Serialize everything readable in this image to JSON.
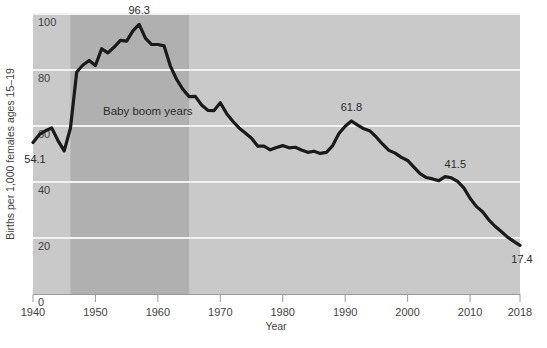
{
  "chart_data": {
    "type": "line",
    "title": "",
    "xlabel": "Year",
    "ylabel": "Births per 1,000 females ages 15–19",
    "xlim": [
      1940,
      2018
    ],
    "ylim": [
      0,
      100
    ],
    "yticks": [
      0,
      20,
      40,
      60,
      80,
      100
    ],
    "ytick_labels": [
      "0",
      "20",
      "40",
      "60",
      "80",
      "100"
    ],
    "xticks": [
      1940,
      1950,
      1960,
      1970,
      1980,
      1990,
      2000,
      2010,
      2018
    ],
    "xtick_labels": [
      "1940",
      "1950",
      "1960",
      "1970",
      "1980",
      "1990",
      "2000",
      "2010",
      "2018"
    ],
    "grid": "horizontal",
    "legend": "none",
    "plot_background": "#c9c9c9",
    "gridline_color": "#f2f2f2",
    "line_color": "#1a1a1a",
    "line_width": 3.2,
    "shaded_band": {
      "label": "Baby boom years",
      "start": 1946,
      "end": 1965,
      "color": "#b0b0b0"
    },
    "annotations": [
      {
        "label": "54.1",
        "x": 1940,
        "y": 54.1
      },
      {
        "label": "96.3",
        "x": 1957,
        "y": 96.3
      },
      {
        "label": "61.8",
        "x": 1991,
        "y": 61.8
      },
      {
        "label": "41.5",
        "x": 2007,
        "y": 41.5
      },
      {
        "label": "17.4",
        "x": 2018,
        "y": 17.4
      }
    ],
    "x": [
      1940,
      1941,
      1942,
      1943,
      1944,
      1945,
      1946,
      1947,
      1948,
      1949,
      1950,
      1951,
      1952,
      1953,
      1954,
      1955,
      1956,
      1957,
      1958,
      1959,
      1960,
      1961,
      1962,
      1963,
      1964,
      1965,
      1966,
      1967,
      1968,
      1969,
      1970,
      1971,
      1972,
      1973,
      1974,
      1975,
      1976,
      1977,
      1978,
      1979,
      1980,
      1981,
      1982,
      1983,
      1984,
      1985,
      1986,
      1987,
      1988,
      1989,
      1990,
      1991,
      1992,
      1993,
      1994,
      1995,
      1996,
      1997,
      1998,
      1999,
      2000,
      2001,
      2002,
      2003,
      2004,
      2005,
      2006,
      2007,
      2008,
      2009,
      2010,
      2011,
      2012,
      2013,
      2014,
      2015,
      2016,
      2017,
      2018
    ],
    "values": [
      54.1,
      56.9,
      58.3,
      59.3,
      54.8,
      51.1,
      59.3,
      79.3,
      81.8,
      83.4,
      81.6,
      87.6,
      86.1,
      88.2,
      90.6,
      90.3,
      94.0,
      96.3,
      91.4,
      89.1,
      89.1,
      88.6,
      81.4,
      76.7,
      73.1,
      70.5,
      70.6,
      67.5,
      65.6,
      65.5,
      68.3,
      64.5,
      61.7,
      59.3,
      57.5,
      55.6,
      52.8,
      52.8,
      51.5,
      52.3,
      53.0,
      52.2,
      52.4,
      51.4,
      50.6,
      51.0,
      50.2,
      50.6,
      53.0,
      57.3,
      59.9,
      61.8,
      60.3,
      59.0,
      58.2,
      56.0,
      53.5,
      51.3,
      50.3,
      48.8,
      47.7,
      45.3,
      43.0,
      41.6,
      41.1,
      40.5,
      41.9,
      41.5,
      40.2,
      37.9,
      34.2,
      31.3,
      29.4,
      26.5,
      24.2,
      22.3,
      20.3,
      18.8,
      17.4
    ]
  }
}
